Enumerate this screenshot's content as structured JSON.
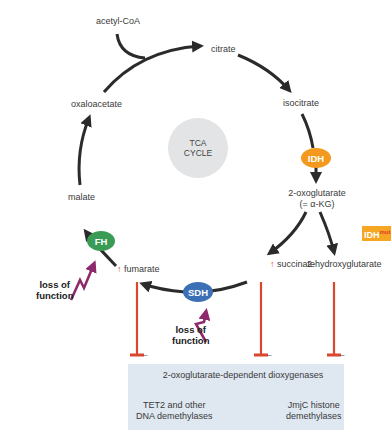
{
  "diagram": {
    "title": "TCA CYCLE",
    "center_label": {
      "line1": "TCA",
      "line2": "CYCLE"
    },
    "metabolites": {
      "acetyl_coa": "acetyl-CoA",
      "citrate": "citrate",
      "isocitrate": "isocitrate",
      "oxoglutarate_line1": "2-oxoglutarate",
      "oxoglutarate_line2": "(= α-KG)",
      "succinate": "succinate",
      "fumarate": "fumarate",
      "malate": "malate",
      "oxaloacetate": "oxaloacetate",
      "hydroxyglutarate": "2-hydroxyglutarate"
    },
    "enzymes": {
      "idh": "IDH",
      "idh_mut": "IDH",
      "idh_mut_sup": "mut.",
      "sdh": "SDH",
      "fh": "FH"
    },
    "annotations": {
      "increase_arrow": "↑",
      "loss_of_function_1_line1": "loss of",
      "loss_of_function_1_line2": "function",
      "loss_of_function_2_line1": "loss of",
      "loss_of_function_2_line2": "function",
      "inhibit_sign": "–"
    },
    "target_box": {
      "title": "2-oxoglutarate-dependent dioxygenases",
      "left_line1": "TET2 and other",
      "left_line2": "DNA demethylases",
      "right_line1": "JmjC histone",
      "right_line2": "demethylases"
    },
    "colors": {
      "arrow": "#2b2b2b",
      "idh": "#f39a1e",
      "idh_mut": "#f5a623",
      "idh_mut_sup": "#e53a2a",
      "sdh": "#3b6fb6",
      "fh": "#3a9b55",
      "inhibit": "#d9472f",
      "lightning": "#8e2a6b",
      "tca_circle": "#e3e4e6",
      "box": "#dfe7f1"
    }
  }
}
